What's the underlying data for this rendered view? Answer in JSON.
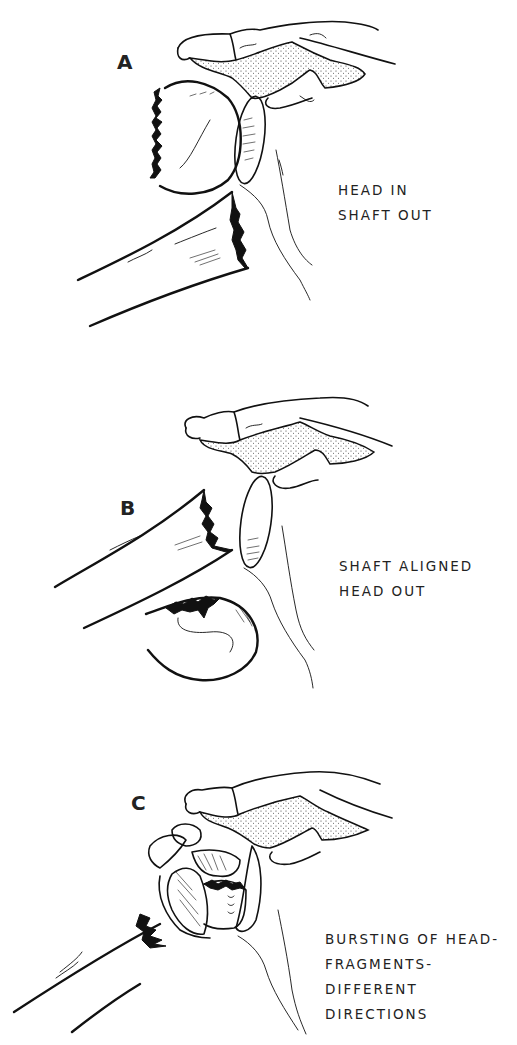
{
  "figure": {
    "colors": {
      "background": "#ffffff",
      "ink": "#111111"
    },
    "panels": [
      {
        "id": "A",
        "letter": "A",
        "caption_lines": [
          "HEAD IN",
          "SHAFT OUT"
        ]
      },
      {
        "id": "B",
        "letter": "B",
        "caption_lines": [
          "SHAFT ALIGNED",
          "HEAD OUT"
        ]
      },
      {
        "id": "C",
        "letter": "C",
        "caption_lines": [
          "BURSTING OF HEAD-",
          "FRAGMENTS-",
          "DIFFERENT",
          "DIRECTIONS"
        ]
      }
    ]
  }
}
